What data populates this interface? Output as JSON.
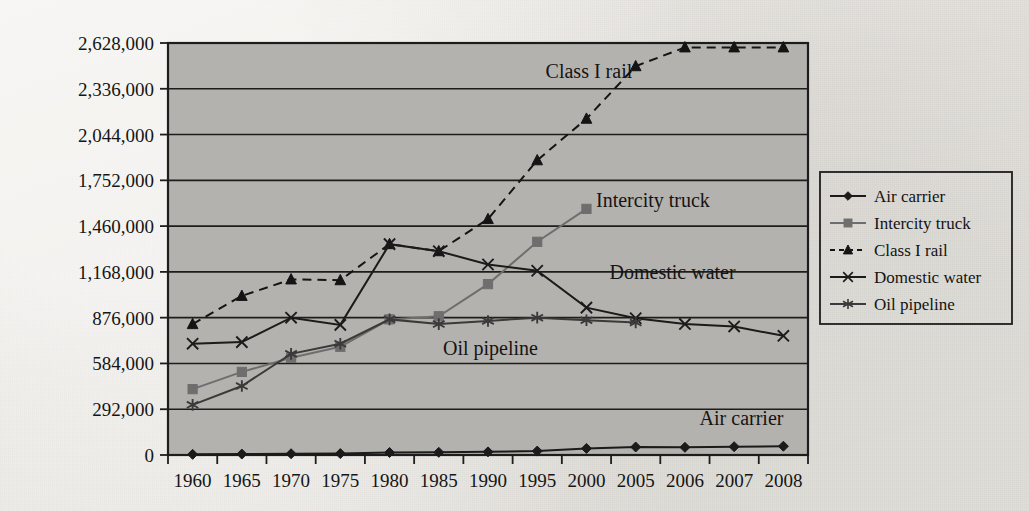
{
  "figure": {
    "kind": "line-chart",
    "background_color": "#e9e7e2",
    "plot_fill_color": "#b4b2ae",
    "plot_border_color": "#1d1d1d"
  },
  "chart_data": {
    "type": "line",
    "title": "",
    "subtitle": "",
    "xlabel": "",
    "ylabel": "",
    "grid": "horizontal",
    "legend_position": "right",
    "x": [
      "1960",
      "1965",
      "1970",
      "1975",
      "1980",
      "1985",
      "1990",
      "1995",
      "2000",
      "2005",
      "2006",
      "2007",
      "2008"
    ],
    "categories": [
      "1960",
      "1965",
      "1970",
      "1975",
      "1980",
      "1985",
      "1990",
      "1995",
      "2000",
      "2005",
      "2006",
      "2007",
      "2008"
    ],
    "ylim": [
      0,
      2628000
    ],
    "ytick_values": [
      0,
      292000,
      584000,
      876000,
      1168000,
      1460000,
      1752000,
      2044000,
      2336000,
      2628000
    ],
    "ytick_labels": [
      "0",
      "292,000",
      "584,000",
      "876,000",
      "1,168,000",
      "1,460,000",
      "1,752,000",
      "2,044,000",
      "2,336,000",
      "2,628,000"
    ],
    "series": [
      {
        "name": "Air carrier",
        "marker": "diamond",
        "line_style": "solid",
        "color": "#1b1b1b",
        "values": [
          4000,
          6000,
          8000,
          9000,
          16000,
          17000,
          20000,
          25000,
          42000,
          51000,
          49000,
          53000,
          56000
        ]
      },
      {
        "name": "Intercity truck",
        "marker": "square",
        "line_style": "solid",
        "color": "#6e6e6e",
        "values": [
          420000,
          530000,
          620000,
          690000,
          865000,
          885000,
          1090000,
          1360000,
          1570000,
          null,
          null,
          null,
          null
        ]
      },
      {
        "name": "Class I rail",
        "marker": "triangle",
        "line_style": "dashed",
        "color": "#141414",
        "values": [
          835000,
          1015000,
          1120000,
          1115000,
          1345000,
          1300000,
          1505000,
          1880000,
          2145000,
          2480000,
          2600000,
          2600000,
          2600000
        ]
      },
      {
        "name": "Domestic water",
        "marker": "x",
        "line_style": "solid",
        "color": "#1b1b1b",
        "values": [
          710000,
          720000,
          876000,
          830000,
          1345000,
          1300000,
          1215000,
          1175000,
          940000,
          872000,
          835000,
          820000,
          760000
        ]
      },
      {
        "name": "Oil pipeline",
        "marker": "asterisk",
        "line_style": "solid",
        "color": "#3a3a3a",
        "values": [
          320000,
          440000,
          645000,
          710000,
          865000,
          835000,
          855000,
          876000,
          860000,
          845000,
          null,
          null,
          null
        ]
      }
    ],
    "annotations": [
      {
        "text": "Class I rail",
        "x_index": 8.05,
        "y_value": 2405000
      },
      {
        "text": "Intercity truck",
        "x_index": 9.35,
        "y_value": 1585000
      },
      {
        "text": "Domestic water",
        "x_index": 9.75,
        "y_value": 1120000
      },
      {
        "text": "Oil pipeline",
        "x_index": 6.05,
        "y_value": 640000
      },
      {
        "text": "Air carrier",
        "x_index": 11.15,
        "y_value": 190000
      }
    ]
  },
  "legend": {
    "items": [
      {
        "label": "Air carrier",
        "marker": "diamond",
        "line_style": "solid",
        "color": "#1b1b1b"
      },
      {
        "label": "Intercity truck",
        "marker": "square",
        "line_style": "solid",
        "color": "#6e6e6e"
      },
      {
        "label": "Class I rail",
        "marker": "triangle",
        "line_style": "dashed",
        "color": "#141414"
      },
      {
        "label": "Domestic water",
        "marker": "x",
        "line_style": "solid",
        "color": "#1b1b1b"
      },
      {
        "label": "Oil pipeline",
        "marker": "asterisk",
        "line_style": "solid",
        "color": "#3a3a3a"
      }
    ]
  }
}
